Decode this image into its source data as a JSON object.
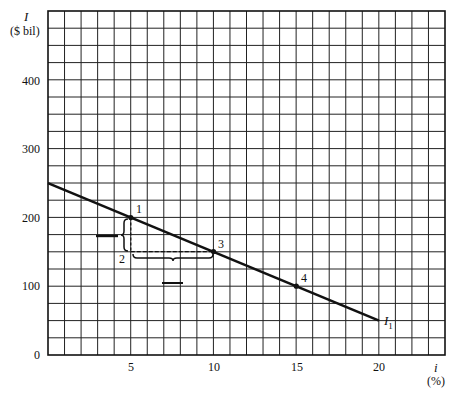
{
  "chart_data": {
    "type": "line",
    "title": "",
    "xlabel": "i",
    "xlabel_unit": "(%)",
    "ylabel": "I",
    "ylabel_unit": "($ bil)",
    "xlim": [
      0,
      24
    ],
    "ylim": [
      0,
      500
    ],
    "grid": true,
    "grid_x_step": 1,
    "grid_y_step": 25,
    "x_ticks": [
      5,
      10,
      15,
      20
    ],
    "x_tick_labels": [
      "5",
      "10",
      "15",
      "20"
    ],
    "y_ticks": [
      0,
      100,
      200,
      300,
      400
    ],
    "y_tick_labels": [
      "0",
      "100",
      "200",
      "300",
      "400"
    ],
    "series": [
      {
        "name": "I1",
        "label": "I",
        "label_sub": "1",
        "x": [
          0,
          20
        ],
        "y": [
          250,
          50
        ]
      }
    ],
    "points": [
      {
        "label": "1",
        "x": 5,
        "y": 200
      },
      {
        "label": "2",
        "x": 5,
        "y": 150
      },
      {
        "label": "3",
        "x": 10,
        "y": 150
      },
      {
        "label": "4",
        "x": 15,
        "y": 100
      }
    ],
    "annotations": [
      {
        "type": "dashed-segment",
        "from": [
          5,
          200
        ],
        "to": [
          5,
          150
        ]
      },
      {
        "type": "dashed-segment",
        "from": [
          5,
          150
        ],
        "to": [
          10,
          150
        ]
      },
      {
        "type": "brace-vertical",
        "between": [
          200,
          150
        ],
        "at_x": 5,
        "blank": true
      },
      {
        "type": "brace-horizontal",
        "between": [
          5,
          10
        ],
        "at_y": 150,
        "blank": true
      }
    ]
  },
  "labels": {
    "y_axis_symbol": "I",
    "y_axis_unit": "($ bil)",
    "x_axis_symbol": "i",
    "x_axis_unit": "(%)",
    "curve_symbol": "I",
    "curve_sub": "1",
    "y_ticks": [
      "400",
      "300",
      "200",
      "100",
      "0"
    ],
    "x_ticks": [
      "5",
      "10",
      "15",
      "20"
    ],
    "points": [
      "1",
      "2",
      "3",
      "4"
    ]
  }
}
